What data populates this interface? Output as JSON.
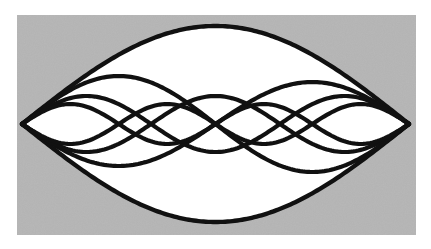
{
  "figure": {
    "background": {
      "x": 17,
      "y": 15,
      "width": 399,
      "height": 220,
      "color": "#b4b4b4",
      "noise": true
    },
    "string": {
      "left_node": [
        22,
        124
      ],
      "right_node": [
        409,
        124
      ],
      "axis_y": 124
    },
    "curve_color": "#111111",
    "envelope": {
      "harmonic": 1,
      "amplitude": 98
    },
    "modes": [
      {
        "harmonic": 2,
        "amplitude": 48
      },
      {
        "harmonic": 2,
        "amplitude": -42
      },
      {
        "harmonic": 3,
        "amplitude": 28
      },
      {
        "harmonic": 3,
        "amplitude": -28
      },
      {
        "harmonic": 4,
        "amplitude": 20
      },
      {
        "harmonic": 4,
        "amplitude": -20
      }
    ]
  }
}
